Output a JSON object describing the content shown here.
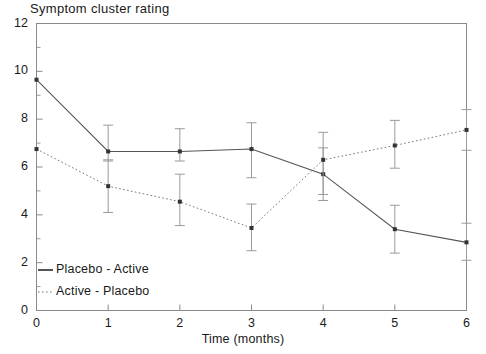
{
  "chart_data": {
    "type": "line",
    "title": "Symptom cluster rating",
    "xlabel": "Time (months)",
    "ylabel": "",
    "x": [
      0,
      1,
      2,
      3,
      4,
      5,
      6
    ],
    "xtick_labels": [
      "0",
      "1",
      "2",
      "3",
      "4",
      "5",
      "6"
    ],
    "ytick_labels": [
      "0",
      "2",
      "4",
      "6",
      "8",
      "10",
      "12"
    ],
    "ytick_values": [
      0,
      2,
      4,
      6,
      8,
      10,
      12
    ],
    "yminor_values": [
      1,
      3,
      5,
      7,
      9,
      11
    ],
    "xlim": [
      0,
      6
    ],
    "ylim": [
      0,
      12
    ],
    "grid": false,
    "legend_position": "bottom-left",
    "series": [
      {
        "name": "Placebo - Active",
        "style": "solid",
        "color": "#555555",
        "values": [
          9.65,
          6.65,
          6.65,
          6.75,
          5.7,
          3.4,
          2.85
        ],
        "err_low": [
          9.65,
          6.25,
          6.25,
          5.55,
          4.6,
          2.4,
          2.1
        ],
        "err_high": [
          9.65,
          7.75,
          7.6,
          7.85,
          6.8,
          4.4,
          3.65
        ]
      },
      {
        "name": "Active - Placebo",
        "style": "dotted",
        "color": "#777777",
        "values": [
          6.75,
          5.2,
          4.55,
          3.45,
          6.3,
          6.9,
          7.55
        ],
        "err_low": [
          6.75,
          4.1,
          3.55,
          2.5,
          4.85,
          5.95,
          6.7
        ],
        "err_high": [
          6.75,
          6.3,
          5.7,
          4.45,
          7.45,
          7.95,
          8.4
        ]
      }
    ]
  },
  "legend": {
    "items": [
      {
        "label": "Placebo - Active",
        "style": "solid"
      },
      {
        "label": "Active - Placebo",
        "style": "dotted"
      }
    ]
  }
}
